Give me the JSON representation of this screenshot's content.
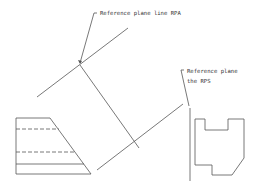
{
  "diagram": {
    "labels": {
      "rpa": "Reference plane line RPA",
      "rps_line1": "Reference plane",
      "rps_line2": "the RPS"
    },
    "colors": {
      "line": "#555555",
      "text": "#333333",
      "background": "#ffffff"
    }
  }
}
